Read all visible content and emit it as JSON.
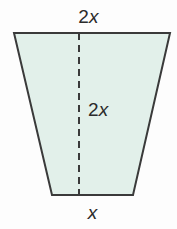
{
  "figure": {
    "kind": "geometry-diagram",
    "shape_name": "trapezoid",
    "background_color": "#fdfdfd",
    "fill_color": "#e2f0ea",
    "stroke_color": "#3a3a3a",
    "label_color": "#2b2b2b",
    "labels": {
      "top_coefficient": "2",
      "top_variable": "x",
      "height_coefficient": "2",
      "height_variable": "x",
      "bottom_variable": "x"
    },
    "geometry": {
      "top_left_x": 14,
      "top_right_x": 170,
      "top_y": 33,
      "bottom_left_x": 52,
      "bottom_right_x": 133,
      "bottom_y": 195,
      "height_line_x": 79,
      "stroke_width": 2,
      "dash_pattern": "7 5"
    }
  }
}
